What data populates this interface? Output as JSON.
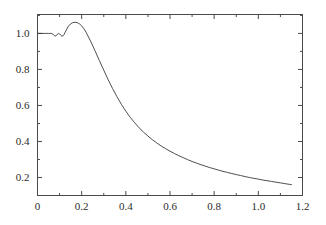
{
  "chart_data": {
    "type": "line",
    "title": "",
    "subtitle": "",
    "xlabel": "",
    "ylabel": "",
    "xlim": [
      0,
      1.2
    ],
    "ylim": [
      0.1,
      1.105
    ],
    "grid": false,
    "legend": null,
    "xticks": [
      0,
      0.2,
      0.4,
      0.6,
      0.8,
      1.0,
      1.2
    ],
    "xtick_labels": [
      "0",
      "0.2",
      "0.4",
      "0.6",
      "0.8",
      "1.0",
      "1.2"
    ],
    "yticks": [
      0.2,
      0.4,
      0.6,
      0.8,
      1.0
    ],
    "ytick_labels": [
      "0.2",
      "0.4",
      "0.6",
      "0.8",
      "1.0"
    ],
    "x_minor_ticks": [
      0.1,
      0.3,
      0.5,
      0.7,
      0.9,
      1.1
    ],
    "y_minor_ticks": [
      0.3,
      0.5,
      0.7,
      0.9,
      1.1
    ],
    "line_color": "#3a3a3a",
    "line_width": 0.9,
    "frame_color": "#4a4a4a",
    "background_color": "#ffffff",
    "series": [
      {
        "name": "curve",
        "x": [
          0.0,
          0.01,
          0.02,
          0.03,
          0.04,
          0.05,
          0.06,
          0.065,
          0.07,
          0.075,
          0.08,
          0.085,
          0.09,
          0.095,
          0.1,
          0.105,
          0.11,
          0.115,
          0.12,
          0.125,
          0.13,
          0.14,
          0.15,
          0.16,
          0.17,
          0.18,
          0.19,
          0.2,
          0.21,
          0.22,
          0.24,
          0.26,
          0.28,
          0.3,
          0.32,
          0.34,
          0.36,
          0.38,
          0.4,
          0.42,
          0.44,
          0.46,
          0.48,
          0.5,
          0.52,
          0.54,
          0.56,
          0.58,
          0.6,
          0.62,
          0.64,
          0.66,
          0.68,
          0.7,
          0.72,
          0.74,
          0.76,
          0.78,
          0.8,
          0.82,
          0.84,
          0.86,
          0.88,
          0.9,
          0.92,
          0.94,
          0.96,
          0.98,
          1.0,
          1.02,
          1.04,
          1.06,
          1.08,
          1.1,
          1.12,
          1.14,
          1.15
        ],
        "y": [
          1.0,
          1.0,
          1.0,
          1.0,
          1.0,
          1.0,
          1.0,
          0.999,
          0.996,
          0.989,
          0.985,
          0.988,
          0.996,
          1.0,
          0.997,
          0.99,
          0.985,
          0.986,
          0.994,
          1.006,
          1.018,
          1.04,
          1.053,
          1.06,
          1.062,
          1.06,
          1.053,
          1.042,
          1.026,
          1.006,
          0.958,
          0.905,
          0.85,
          0.796,
          0.743,
          0.694,
          0.648,
          0.606,
          0.568,
          0.534,
          0.504,
          0.476,
          0.452,
          0.43,
          0.41,
          0.392,
          0.375,
          0.36,
          0.346,
          0.333,
          0.321,
          0.31,
          0.299,
          0.289,
          0.28,
          0.271,
          0.263,
          0.255,
          0.248,
          0.241,
          0.234,
          0.228,
          0.222,
          0.216,
          0.211,
          0.205,
          0.2,
          0.195,
          0.191,
          0.186,
          0.182,
          0.178,
          0.174,
          0.17,
          0.166,
          0.162,
          0.16
        ]
      }
    ],
    "annotations": [
      {
        "text": "curve starts flat at 1.0 then shows small oscillations near x = 0.07-0.12"
      },
      {
        "text": "peak value approximately 1.06 near x = 0.18"
      },
      {
        "text": "monotonic decay to approximately 0.16 at x = 1.15"
      }
    ]
  }
}
